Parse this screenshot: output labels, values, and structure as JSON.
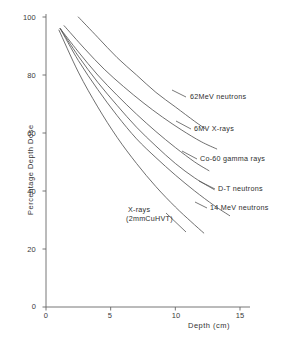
{
  "chart_data": {
    "type": "line",
    "title": "",
    "xlabel": "Depth (cm)",
    "ylabel": "Percentage Depth Dose",
    "xlim": [
      0,
      15
    ],
    "ylim": [
      0,
      100
    ],
    "xticks": [
      "0",
      "5",
      "10",
      "15"
    ],
    "xtick_values": [
      0,
      5,
      10,
      15
    ],
    "yticks": [
      "20",
      "40",
      "60",
      "80",
      "100"
    ],
    "ytick_values": [
      20,
      40,
      60,
      80,
      100
    ],
    "grid": false,
    "legend_position": "inline-at-curve-ends",
    "series": [
      {
        "name": "62MeV neutrons",
        "label": "62MeV neutrons",
        "x": [
          2.5,
          4,
          5.5,
          7,
          8.5,
          10,
          11.5,
          12.3
        ],
        "y": [
          100,
          93,
          86,
          80,
          74,
          69,
          64,
          61.5
        ]
      },
      {
        "name": "6MV X-rays",
        "label": "6MV X-rays",
        "x": [
          1.4,
          3,
          4.5,
          6,
          7.5,
          9,
          10.5,
          12,
          13.2
        ],
        "y": [
          97,
          89,
          82,
          76,
          70.5,
          65.5,
          61,
          57,
          54.5
        ]
      },
      {
        "name": "Co-60 gamma rays",
        "label": "Co-60 gamma rays",
        "x": [
          1.1,
          2.5,
          4,
          5.5,
          7,
          8.5,
          10,
          11.5,
          12.6
        ],
        "y": [
          96,
          88,
          80,
          73,
          66.5,
          60.5,
          55,
          50,
          47
        ]
      },
      {
        "name": "D-T neutrons",
        "label": "D-T neutrons",
        "x": [
          1.1,
          2.5,
          4,
          5.5,
          7,
          8.5,
          10,
          11.5,
          13
        ],
        "y": [
          96,
          86.5,
          77.5,
          69.5,
          62,
          55.5,
          49.5,
          44.5,
          40.5
        ]
      },
      {
        "name": "14 MeV neutrons",
        "label": "14 MeV neutrons",
        "x": [
          1.1,
          2.5,
          4,
          5.5,
          7,
          8.5,
          10,
          11.5,
          13,
          14.2
        ],
        "y": [
          96,
          85,
          75,
          66,
          58,
          51.5,
          45.5,
          40,
          35,
          31.5
        ]
      },
      {
        "name": "X-rays (2mmCuHVT)",
        "label_line1": "X-rays",
        "label_line2": "(2mmCuHVT)",
        "x": [
          1.0,
          2.5,
          4,
          5.5,
          7,
          8.5,
          10,
          11.2,
          12.2
        ],
        "y": [
          95.5,
          81,
          69,
          58.5,
          49.5,
          41.5,
          34.5,
          29.5,
          25.5
        ]
      }
    ]
  },
  "axes": {
    "x_title": "Depth (cm)",
    "y_title": "Percentage Depth Dose"
  },
  "labels": {
    "neutrons62": "62MeV neutrons",
    "xrays6mv": "6MV X-rays",
    "co60": "Co-60 gamma rays",
    "dt": "D-T neutrons",
    "mev14": "14 MeV neutrons",
    "orthoA": "X-rays",
    "orthoB": "(2mmCuHVT)"
  },
  "style": {
    "line_color": "#555555",
    "axis_color": "#666666",
    "text_color": "#2e2e2e",
    "background": "#ffffff"
  }
}
